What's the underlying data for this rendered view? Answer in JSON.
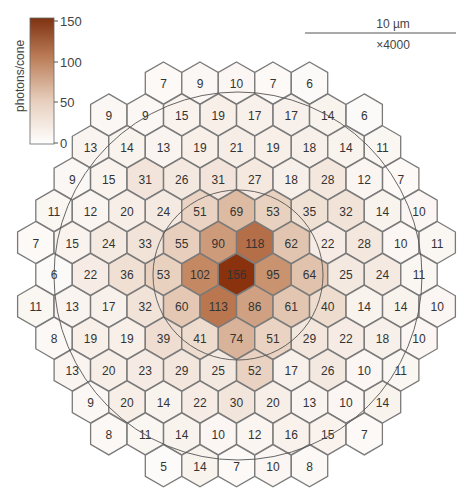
{
  "colorbar": {
    "title": "photons/cone",
    "ticks": [
      "150",
      "100",
      "50",
      "0"
    ],
    "tick_values": [
      150,
      100,
      50,
      0
    ],
    "color_low": "#ffffff",
    "color_high": "#8a3a14"
  },
  "scale_bar": {
    "length_label": "10 µm",
    "magnification_label": "×4000"
  },
  "grid": {
    "rows": [
      {
        "start_col": 3,
        "half": false,
        "values": [
          7,
          9,
          10,
          7,
          6
        ]
      },
      {
        "start_col": 2,
        "half": true,
        "values": [
          9,
          9,
          15,
          19,
          17,
          17,
          14,
          6
        ]
      },
      {
        "start_col": 1,
        "half": false,
        "values": [
          13,
          14,
          13,
          19,
          21,
          19,
          18,
          14,
          11
        ]
      },
      {
        "start_col": 1,
        "half": true,
        "values": [
          9,
          15,
          31,
          26,
          31,
          27,
          18,
          28,
          12,
          7
        ]
      },
      {
        "start_col": 0,
        "half": false,
        "values": [
          11,
          12,
          20,
          24,
          51,
          69,
          53,
          35,
          32,
          14,
          10
        ]
      },
      {
        "start_col": 0,
        "half": true,
        "values": [
          7,
          15,
          24,
          33,
          55,
          90,
          118,
          62,
          22,
          28,
          10,
          11
        ]
      },
      {
        "start_col": 0,
        "half": false,
        "values": [
          6,
          22,
          36,
          53,
          102,
          156,
          95,
          64,
          25,
          24,
          11
        ]
      },
      {
        "start_col": 0,
        "half": true,
        "values": [
          11,
          13,
          17,
          32,
          60,
          113,
          86,
          61,
          40,
          14,
          14,
          10
        ]
      },
      {
        "start_col": 0,
        "half": false,
        "values": [
          8,
          19,
          19,
          39,
          41,
          74,
          51,
          29,
          22,
          18,
          10
        ]
      },
      {
        "start_col": 1,
        "half": true,
        "values": [
          13,
          20,
          23,
          29,
          25,
          52,
          17,
          26,
          10,
          11
        ]
      },
      {
        "start_col": 1,
        "half": false,
        "values": [
          9,
          20,
          14,
          22,
          30,
          20,
          13,
          10,
          14
        ]
      },
      {
        "start_col": 2,
        "half": true,
        "values": [
          8,
          11,
          14,
          10,
          12,
          16,
          15,
          7
        ]
      },
      {
        "start_col": 3,
        "half": false,
        "values": [
          5,
          14,
          7,
          10,
          8
        ]
      }
    ]
  },
  "chart_data": {
    "type": "heatmap",
    "title": "",
    "colorbar_label": "photons/cone",
    "colorbar_range": [
      0,
      150
    ],
    "scale_bar": "10 µm",
    "magnification": "×4000",
    "rows": [
      [
        7,
        9,
        10,
        7,
        6
      ],
      [
        9,
        9,
        15,
        19,
        17,
        17,
        14,
        6
      ],
      [
        13,
        14,
        13,
        19,
        21,
        19,
        18,
        14,
        11
      ],
      [
        9,
        15,
        31,
        26,
        31,
        27,
        18,
        28,
        12,
        7
      ],
      [
        11,
        12,
        20,
        24,
        51,
        69,
        53,
        35,
        32,
        14,
        10
      ],
      [
        7,
        15,
        24,
        33,
        55,
        90,
        118,
        62,
        22,
        28,
        10,
        11
      ],
      [
        6,
        22,
        36,
        53,
        102,
        156,
        95,
        64,
        25,
        24,
        11
      ],
      [
        11,
        13,
        17,
        32,
        60,
        113,
        86,
        61,
        40,
        14,
        14,
        10
      ],
      [
        8,
        19,
        19,
        39,
        41,
        74,
        51,
        29,
        22,
        18,
        10
      ],
      [
        13,
        20,
        23,
        29,
        25,
        52,
        17,
        26,
        10,
        11
      ],
      [
        9,
        20,
        14,
        22,
        30,
        20,
        13,
        10,
        14
      ],
      [
        8,
        11,
        14,
        10,
        12,
        16,
        15,
        7
      ],
      [
        5,
        14,
        7,
        10,
        8
      ]
    ],
    "max_value": 156
  }
}
